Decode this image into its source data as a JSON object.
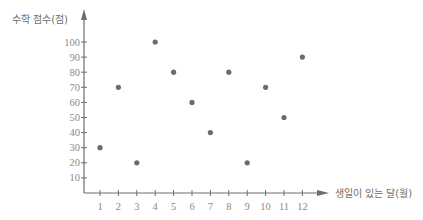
{
  "chart_data": {
    "type": "scatter",
    "title": "",
    "xlabel": "생일이 있는 달(월)",
    "ylabel": "수학 점수(점)",
    "x_ticks": [
      1,
      2,
      3,
      4,
      5,
      6,
      7,
      8,
      9,
      10,
      11,
      12
    ],
    "y_ticks": [
      10,
      20,
      30,
      40,
      50,
      60,
      70,
      80,
      90,
      100
    ],
    "xlim": [
      0,
      13
    ],
    "ylim": [
      0,
      105
    ],
    "grid": false,
    "legend": null,
    "points": [
      {
        "x": 1,
        "y": 30
      },
      {
        "x": 2,
        "y": 70
      },
      {
        "x": 3,
        "y": 20
      },
      {
        "x": 4,
        "y": 100
      },
      {
        "x": 5,
        "y": 80
      },
      {
        "x": 6,
        "y": 60
      },
      {
        "x": 7,
        "y": 40
      },
      {
        "x": 8,
        "y": 80
      },
      {
        "x": 9,
        "y": 20
      },
      {
        "x": 10,
        "y": 70
      },
      {
        "x": 11,
        "y": 50
      },
      {
        "x": 12,
        "y": 90
      }
    ],
    "colors": {
      "axis": "#6e6e6e",
      "point": "#6b6b6b",
      "tick_label": "#8a8a8a"
    }
  }
}
